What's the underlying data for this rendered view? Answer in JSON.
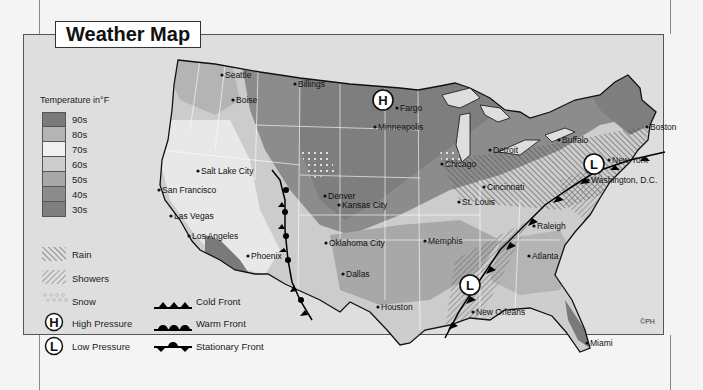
{
  "title": "Weather Map",
  "legend": {
    "temperature_title": "Temperature in°F",
    "temperature_bands": [
      {
        "label": "90s",
        "color": "#7a7a7a"
      },
      {
        "label": "80s",
        "color": "#b4b4b4"
      },
      {
        "label": "70s",
        "color": "#f0f0f0"
      },
      {
        "label": "60s",
        "color": "#cdcdcd"
      },
      {
        "label": "50s",
        "color": "#a8a8a8"
      },
      {
        "label": "40s",
        "color": "#8c8c8c"
      },
      {
        "label": "30s",
        "color": "#7f7f7f"
      }
    ],
    "precip": [
      {
        "label": "Rain",
        "icon": "rain-hatch-icon"
      },
      {
        "label": "Showers",
        "icon": "showers-hatch-icon"
      },
      {
        "label": "Snow",
        "icon": "snow-dots-icon"
      }
    ],
    "pressure": [
      {
        "label": "High Pressure",
        "symbol": "H",
        "icon": "high-pressure-icon"
      },
      {
        "label": "Low Pressure",
        "symbol": "L",
        "icon": "low-pressure-icon"
      }
    ],
    "fronts": [
      {
        "label": "Cold Front",
        "icon": "cold-front-icon"
      },
      {
        "label": "Warm Front",
        "icon": "warm-front-icon"
      },
      {
        "label": "Stationary Front",
        "icon": "stationary-front-icon"
      }
    ]
  },
  "cities": [
    {
      "name": "Seattle",
      "x": 225,
      "y": 78
    },
    {
      "name": "Billings",
      "x": 298,
      "y": 87
    },
    {
      "name": "Fargo",
      "x": 400,
      "y": 111
    },
    {
      "name": "Boise",
      "x": 236,
      "y": 103
    },
    {
      "name": "Minneapolis",
      "x": 378,
      "y": 130
    },
    {
      "name": "Salt Lake City",
      "x": 201,
      "y": 174
    },
    {
      "name": "Denver",
      "x": 328,
      "y": 199
    },
    {
      "name": "Chicago",
      "x": 445,
      "y": 167
    },
    {
      "name": "Detroit",
      "x": 493,
      "y": 153
    },
    {
      "name": "Buffalo",
      "x": 562,
      "y": 143
    },
    {
      "name": "Boston",
      "x": 650,
      "y": 130
    },
    {
      "name": "New York",
      "x": 612,
      "y": 163
    },
    {
      "name": "Washington, D.C.",
      "x": 591,
      "y": 183
    },
    {
      "name": "Cincinnati",
      "x": 487,
      "y": 190
    },
    {
      "name": "Kansas City",
      "x": 342,
      "y": 208
    },
    {
      "name": "St. Louis",
      "x": 462,
      "y": 205
    },
    {
      "name": "San Francisco",
      "x": 162,
      "y": 193
    },
    {
      "name": "Las Vegas",
      "x": 174,
      "y": 219
    },
    {
      "name": "Los Angeles",
      "x": 192,
      "y": 239
    },
    {
      "name": "Phoenix",
      "x": 251,
      "y": 259
    },
    {
      "name": "Oklahoma City",
      "x": 329,
      "y": 246
    },
    {
      "name": "Memphis",
      "x": 428,
      "y": 244
    },
    {
      "name": "Raleigh",
      "x": 537,
      "y": 229
    },
    {
      "name": "Atlanta",
      "x": 532,
      "y": 259
    },
    {
      "name": "Dallas",
      "x": 346,
      "y": 277
    },
    {
      "name": "Houston",
      "x": 381,
      "y": 310
    },
    {
      "name": "New Orleans",
      "x": 476,
      "y": 315
    },
    {
      "name": "Miami",
      "x": 590,
      "y": 346
    }
  ],
  "pressure_markers": [
    {
      "symbol": "H",
      "x": 383,
      "y": 100
    },
    {
      "symbol": "L",
      "x": 594,
      "y": 164
    },
    {
      "symbol": "L",
      "x": 470,
      "y": 285
    }
  ],
  "copyright": "©PH"
}
